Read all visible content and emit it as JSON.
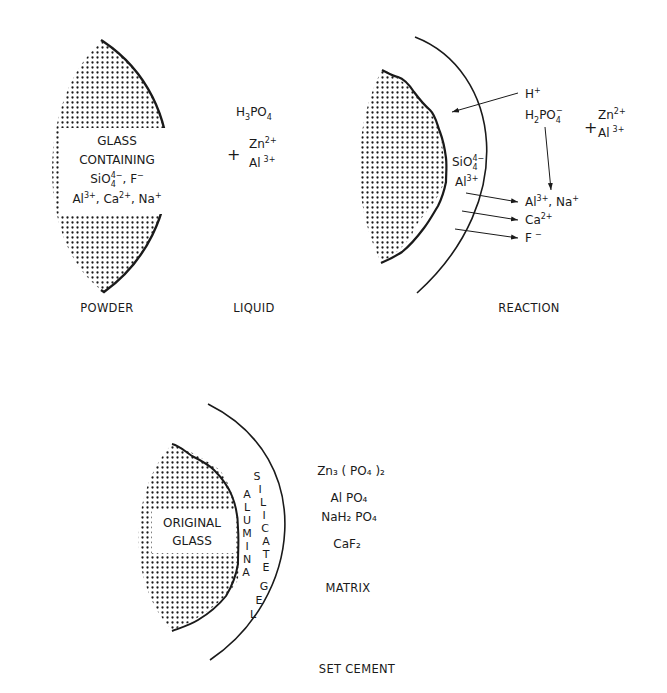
{
  "colors": {
    "ink": "#1a1a1a",
    "background": "#ffffff"
  },
  "panels": {
    "powder": {
      "caption": "POWDER",
      "glass_label": [
        "GLASS",
        "CONTAINING"
      ],
      "ions_line1": {
        "a": "SiO",
        "a_sub": "4",
        "a_sup": "4−",
        "sep": ", ",
        "b": "F",
        "b_sup": "−"
      },
      "ions_line2": {
        "a": "Al",
        "a_sup": "3+",
        "b": "Ca",
        "b_sup": "2+",
        "c": "Na",
        "c_sup": "+"
      }
    },
    "liquid": {
      "caption": "LIQUID",
      "acid": {
        "base": "H",
        "sub1": "3",
        "rest": "PO",
        "sub2": "4"
      },
      "plus": "+",
      "zn": {
        "base": "Zn",
        "sup": "2+"
      },
      "al": {
        "base": "Al",
        "sup": "3+"
      }
    },
    "reaction": {
      "caption": "REACTION",
      "h_ion": {
        "base": "H",
        "sup": "+"
      },
      "phosphate": {
        "base": "H",
        "sub1": "2",
        "rest": "PO",
        "sub2": "4",
        "sup": "−"
      },
      "plus": "+",
      "zn": {
        "base": "Zn",
        "sup": "2+"
      },
      "al": {
        "base": "Al",
        "sup": "3+"
      },
      "surface_ions": [
        {
          "base": "SiO",
          "sub": "4",
          "sup": "4−"
        },
        {
          "base": "Al",
          "sup": "3+"
        }
      ],
      "released_ions": [
        {
          "base": "Al",
          "sup": "3+",
          "sep": ", ",
          "base2": "Na",
          "sup2": "+"
        },
        {
          "base": "Ca",
          "sup": "2+"
        },
        {
          "base": "F",
          "sup": "−"
        }
      ]
    },
    "set_cement": {
      "caption": "SET CEMENT",
      "core_label": [
        "ORIGINAL",
        "GLASS"
      ],
      "gel_inner": [
        "A",
        "L",
        "U",
        "M",
        "I",
        "N",
        "A"
      ],
      "gel_outer": [
        "S",
        "I",
        "L",
        "I",
        "C",
        "A",
        "T",
        "E"
      ],
      "gel_word": [
        "G",
        "E",
        "L"
      ],
      "matrix_products": [
        {
          "text": "Zn₃ ( PO₄ )₂"
        },
        {
          "text": "Al PO₄"
        },
        {
          "text": "NaH₂ PO₄"
        },
        {
          "text": "CaF₂"
        }
      ],
      "matrix_label": "MATRIX"
    }
  }
}
